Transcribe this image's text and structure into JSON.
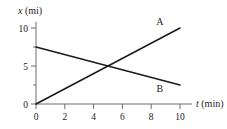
{
  "chart_data": {
    "type": "line",
    "title": "",
    "subtitle": "",
    "xlabel": "t (min)",
    "xlabel_var": "t",
    "xlabel_unit": "(min)",
    "ylabel": "x (mi)",
    "ylabel_var": "x",
    "ylabel_unit": "(mi)",
    "xlim": [
      0,
      10.6
    ],
    "ylim": [
      0,
      10.6
    ],
    "grid": false,
    "legend_position": "inline-endpoint-labels",
    "xticks": [
      0,
      2,
      4,
      6,
      8,
      10
    ],
    "xtick_labels": [
      "0",
      "2",
      "4",
      "6",
      "8",
      "10"
    ],
    "yticks": [
      0,
      5,
      10
    ],
    "ytick_labels": [
      "0",
      "5",
      "10"
    ],
    "yticks_minor": [
      2.5,
      7.5
    ],
    "series": [
      {
        "name": "A",
        "label": "A",
        "color": "#1a1a1a",
        "x": [
          0,
          10
        ],
        "values": [
          0,
          10
        ],
        "label_x": 8.6,
        "label_y": 10.4
      },
      {
        "name": "B",
        "label": "B",
        "color": "#1a1a1a",
        "x": [
          0,
          10
        ],
        "values": [
          7.5,
          2.5
        ],
        "label_x": 8.6,
        "label_y": 1.6
      }
    ],
    "intersection": {
      "x": 5,
      "y": 5
    },
    "axis_color": "#6e6e6e",
    "line_color": "#1a1a1a",
    "background": "#ffffff"
  }
}
